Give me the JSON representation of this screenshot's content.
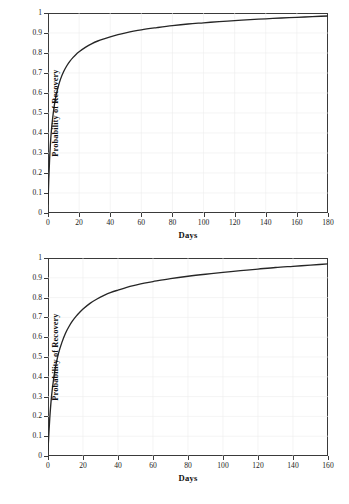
{
  "figure": {
    "background": "#ffffff",
    "axis_color": "#3a3a3a",
    "curve_color": "#262626",
    "grid_color": "#ededed"
  },
  "chart_data": [
    {
      "id": "chart-1",
      "type": "line",
      "title": "",
      "subtitle": "",
      "xlabel": "Days",
      "ylabel": "Probability of Recovery",
      "xlim": [
        0,
        180
      ],
      "ylim": [
        0,
        1
      ],
      "xticks": [
        0,
        20,
        40,
        60,
        80,
        100,
        120,
        140,
        160,
        180
      ],
      "yticks": [
        0,
        0.1,
        0.2,
        0.3,
        0.4,
        0.5,
        0.6,
        0.7,
        0.8,
        0.9,
        1
      ],
      "xticklabels": [
        "0",
        "20",
        "40",
        "60",
        "80",
        "100",
        "120",
        "140",
        "160",
        "180"
      ],
      "yticklabels": [
        "0",
        "0.1",
        "0.2",
        "0.3",
        "0.4",
        "0.5",
        "0.6",
        "0.7",
        "0.8",
        "0.9",
        "1"
      ],
      "grid": true,
      "legend": null,
      "series": [
        {
          "name": "Probability of Recovery",
          "color": "#262626",
          "x": [
            0,
            0.5,
            1,
            2,
            3,
            4,
            5,
            6,
            8,
            10,
            12,
            14,
            16,
            18,
            20,
            24,
            28,
            32,
            36,
            40,
            45,
            50,
            55,
            60,
            70,
            80,
            90,
            100,
            110,
            120,
            130,
            140,
            150,
            160,
            170,
            180
          ],
          "y": [
            0.045,
            0.17,
            0.265,
            0.395,
            0.475,
            0.535,
            0.58,
            0.615,
            0.668,
            0.706,
            0.735,
            0.758,
            0.777,
            0.793,
            0.806,
            0.828,
            0.846,
            0.86,
            0.871,
            0.881,
            0.892,
            0.901,
            0.909,
            0.916,
            0.927,
            0.937,
            0.945,
            0.951,
            0.957,
            0.962,
            0.967,
            0.971,
            0.975,
            0.978,
            0.982,
            0.985
          ]
        }
      ]
    },
    {
      "id": "chart-2",
      "type": "line",
      "title": "",
      "subtitle": "",
      "xlabel": "Days",
      "ylabel": "Probability of Recovery",
      "xlim": [
        0,
        160
      ],
      "ylim": [
        0,
        1
      ],
      "xticks": [
        0,
        20,
        40,
        60,
        80,
        100,
        120,
        140,
        160
      ],
      "yticks": [
        0,
        0.1,
        0.2,
        0.3,
        0.4,
        0.5,
        0.6,
        0.7,
        0.8,
        0.9,
        1
      ],
      "xticklabels": [
        "0",
        "20",
        "40",
        "60",
        "80",
        "100",
        "120",
        "140",
        "160"
      ],
      "yticklabels": [
        "0",
        "0.1",
        "0.2",
        "0.3",
        "0.4",
        "0.5",
        "0.6",
        "0.7",
        "0.8",
        "0.9",
        "1"
      ],
      "grid": true,
      "legend": null,
      "series": [
        {
          "name": "Probability of Recovery",
          "color": "#262626",
          "x": [
            0,
            0.5,
            1,
            2,
            3,
            4,
            5,
            6,
            8,
            10,
            12,
            14,
            16,
            18,
            20,
            24,
            28,
            32,
            36,
            40,
            45,
            50,
            55,
            60,
            70,
            80,
            90,
            100,
            110,
            120,
            130,
            140,
            150,
            160
          ],
          "y": [
            0.03,
            0.115,
            0.19,
            0.3,
            0.375,
            0.435,
            0.48,
            0.518,
            0.575,
            0.62,
            0.654,
            0.682,
            0.705,
            0.725,
            0.742,
            0.771,
            0.793,
            0.811,
            0.826,
            0.838,
            0.852,
            0.863,
            0.873,
            0.881,
            0.896,
            0.908,
            0.918,
            0.927,
            0.936,
            0.944,
            0.952,
            0.958,
            0.964,
            0.97
          ]
        }
      ]
    }
  ]
}
